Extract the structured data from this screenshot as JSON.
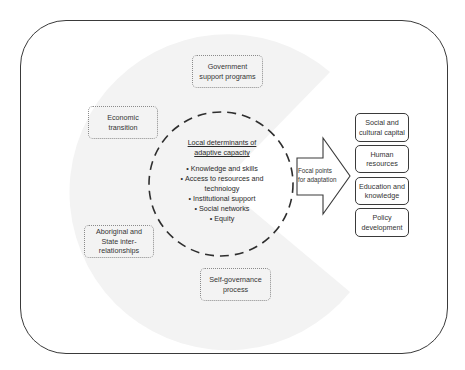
{
  "diagram": {
    "title": "Local determinants of adaptive capacity",
    "center": {
      "title_lines": [
        "Local determinants of",
        "adaptive capacity"
      ],
      "items": [
        "Knowledge and skills",
        "Access to resources and technology",
        "Institutional support",
        "Social networks",
        "Equity"
      ],
      "item_lines": {
        "access_1": "Access to resources and",
        "access_2": "technology"
      }
    },
    "influences": [
      {
        "lines": [
          "Government",
          "support programs"
        ]
      },
      {
        "lines": [
          "Economic",
          "transition"
        ]
      },
      {
        "lines": [
          "Aboriginal and",
          "State inter-",
          "relationships"
        ]
      },
      {
        "lines": [
          "Self-governance",
          "process"
        ]
      }
    ],
    "arrow": {
      "lines": [
        "Focal points",
        "for adaptation"
      ]
    },
    "focal_points": [
      {
        "lines": [
          "Social and",
          "cultural capital"
        ]
      },
      {
        "lines": [
          "Human",
          "resources"
        ]
      },
      {
        "lines": [
          "Education and",
          "knowledge"
        ]
      },
      {
        "lines": [
          "Policy",
          "development"
        ]
      }
    ],
    "colors": {
      "background_shape": "#f3f3f3",
      "stroke": "#3a3a3a",
      "dotted_border": "#8a8a8a"
    }
  }
}
